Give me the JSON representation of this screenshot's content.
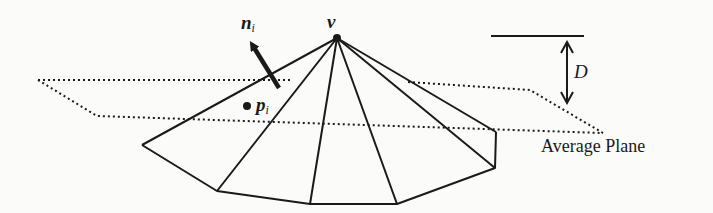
{
  "figure": {
    "type": "diagram",
    "labels": {
      "normal": "n",
      "normal_sub": "i",
      "point": "p",
      "point_sub": "i",
      "vertex": "v",
      "distance": "D",
      "plane": "Average Plane"
    },
    "colors": {
      "stroke": "#1a1a1a",
      "background": "#fbfbfa"
    },
    "geometry": {
      "apex": [
        337,
        38
      ],
      "boundary": [
        [
          142,
          145
        ],
        [
          217,
          191
        ],
        [
          310,
          204
        ],
        [
          397,
          204
        ],
        [
          495,
          168
        ],
        [
          496,
          132
        ]
      ],
      "point_pi": [
        247,
        106
      ],
      "normal_arrow": {
        "from": [
          279,
          88
        ],
        "to": [
          248,
          38
        ]
      },
      "plane_top_edge": [
        [
          38,
          80
        ],
        [
          290,
          80
        ],
        [
          408,
          82
        ],
        [
          530,
          90
        ],
        [
          603,
          133
        ]
      ],
      "plane_bottom_edge": [
        [
          38,
          80
        ],
        [
          97,
          116
        ],
        [
          603,
          133
        ]
      ],
      "distance_bar": {
        "x1": 491,
        "x2": 584,
        "y": 36
      },
      "distance_arrow": {
        "x": 567,
        "y1": 42,
        "y2": 103
      }
    }
  }
}
